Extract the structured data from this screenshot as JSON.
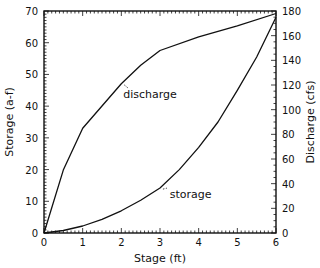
{
  "chart_data": {
    "type": "line",
    "title": "",
    "xlabel": "Stage (ft)",
    "ylabel": "Storage (a-f)",
    "y2label": "Discharge (cfs)",
    "xlim": [
      0,
      6
    ],
    "ylim": [
      0,
      70
    ],
    "y2lim": [
      0,
      180
    ],
    "grid": false,
    "legend": "none",
    "x_ticks": [
      0,
      1,
      2,
      3,
      4,
      5,
      6
    ],
    "y_ticks": [
      0,
      10,
      20,
      30,
      40,
      50,
      60,
      70
    ],
    "y2_ticks": [
      0,
      20,
      40,
      60,
      80,
      100,
      120,
      140,
      160,
      180
    ],
    "series": [
      {
        "name": "storage",
        "axis": "left",
        "x": [
          0,
          0.5,
          1,
          1.5,
          2,
          2.5,
          3,
          3.5,
          4,
          4.5,
          5,
          5.5,
          6
        ],
        "values": [
          0,
          0.8,
          2.2,
          4.3,
          7,
          10.3,
          14.2,
          20,
          27,
          35,
          45,
          55.5,
          68
        ]
      },
      {
        "name": "discharge",
        "axis": "right",
        "x": [
          0,
          0.5,
          1,
          1.5,
          2,
          2.5,
          3,
          4,
          5,
          6
        ],
        "values": [
          0,
          51,
          85,
          103,
          121,
          136,
          148,
          159,
          168,
          178
        ]
      }
    ],
    "annotations": [
      {
        "text": "discharge",
        "series": "discharge",
        "x": 2.05,
        "label_x": 2.05,
        "label_y_left": 42.5
      },
      {
        "text": "storage",
        "series": "storage",
        "x": 3.05,
        "label_x": 3.25,
        "label_y_left": 11.0
      }
    ]
  }
}
